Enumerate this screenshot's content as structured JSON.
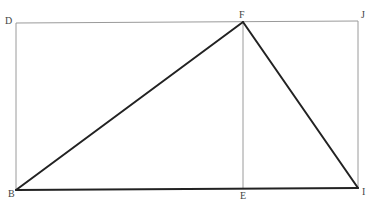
{
  "diagram": {
    "type": "geometry",
    "points": {
      "D": {
        "label": "D",
        "x": 16,
        "y": 23
      },
      "F": {
        "label": "F",
        "x": 243,
        "y": 22
      },
      "J": {
        "label": "J",
        "x": 358,
        "y": 21
      },
      "B": {
        "label": "B",
        "x": 16,
        "y": 190
      },
      "E": {
        "label": "E",
        "x": 243,
        "y": 189
      },
      "I": {
        "label": "I",
        "x": 358,
        "y": 188
      }
    },
    "thin_lines": [
      [
        "D",
        "J"
      ],
      [
        "D",
        "B"
      ],
      [
        "J",
        "I"
      ],
      [
        "F",
        "E"
      ]
    ],
    "thick_lines": [
      [
        "B",
        "F"
      ],
      [
        "F",
        "I"
      ],
      [
        "B",
        "I"
      ]
    ],
    "caption": ""
  }
}
